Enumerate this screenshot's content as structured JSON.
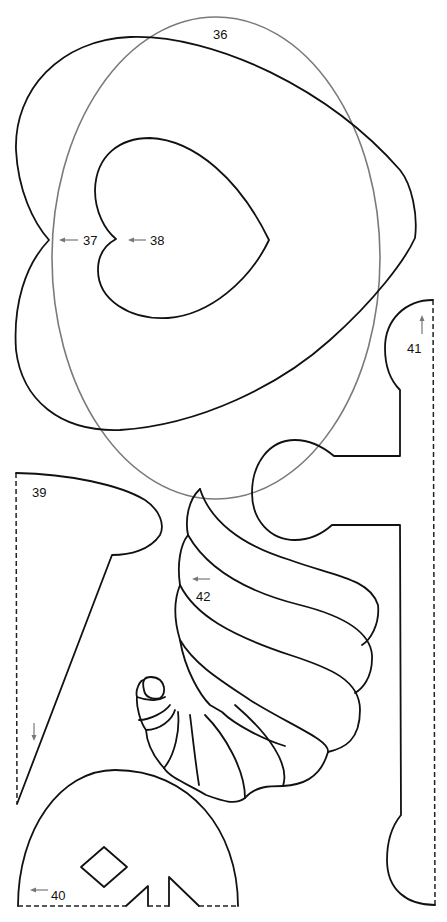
{
  "colors": {
    "cut_line": "#111111",
    "fold_line": "#222222",
    "oval_line": "#7a7a7a",
    "arrow": "#777777",
    "background": "#ffffff"
  },
  "pieces": [
    {
      "id": "36",
      "label": "36",
      "shape": "oval",
      "line": "solid-gray"
    },
    {
      "id": "37",
      "label": "37",
      "shape": "large heart",
      "line": "solid",
      "grain_arrow": "left"
    },
    {
      "id": "38",
      "label": "38",
      "shape": "small heart",
      "line": "solid",
      "grain_arrow": "left"
    },
    {
      "id": "39",
      "label": "39",
      "shape": "half pedestal / vase",
      "line": "solid with dashed fold edge",
      "grain_arrow": "down"
    },
    {
      "id": "40",
      "label": "40",
      "shape": "dome with diamond cutout",
      "line": "solid with dashed fold edge",
      "grain_arrow": "left"
    },
    {
      "id": "41",
      "label": "41",
      "shape": "half column / spindle",
      "line": "solid with dashed fold edge",
      "grain_arrow": "up"
    },
    {
      "id": "42",
      "label": "42",
      "shape": "cornucopia",
      "line": "solid",
      "grain_arrow": "left"
    }
  ]
}
